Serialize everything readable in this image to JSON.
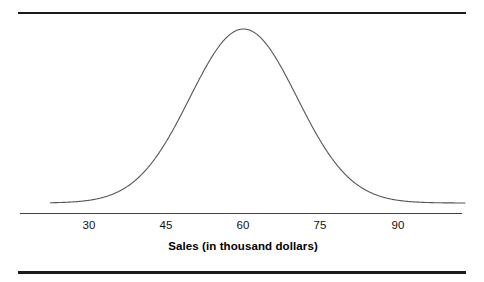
{
  "figure": {
    "background_color": "#ffffff",
    "rule_color": "#1a1a1a",
    "curve_color": "#555555",
    "axis_color": "#444444",
    "top_rule_label": "top-horizontal-rule",
    "bottom_rule_label": "bottom-horizontal-rule"
  },
  "axis": {
    "title": "Sales (in thousand dollars)",
    "tick_labels": [
      "30",
      "45",
      "60",
      "75",
      "90"
    ],
    "tick_values": [
      30,
      45,
      60,
      75,
      90
    ]
  },
  "chart_data": {
    "type": "line",
    "title": "",
    "subtitle": "",
    "xlabel": "Sales (in thousand dollars)",
    "ylabel": "",
    "grid": false,
    "legend": "none",
    "xlim": [
      22.5,
      103.0
    ],
    "ylim": [
      0,
      1.0
    ],
    "xticks": [
      30,
      45,
      60,
      75,
      90
    ],
    "xticklabels": [
      "30",
      "45",
      "60",
      "75",
      "90"
    ],
    "yticks": [],
    "yticklabels": [],
    "distribution": {
      "kind": "normal",
      "mean": 60,
      "sigma": 10.4,
      "peak_x": 60,
      "peak_y": 1.0
    },
    "series": [
      {
        "name": "Normal curve",
        "x": [
          22.5,
          25,
          27.5,
          30,
          32.5,
          35,
          37.5,
          40,
          42.5,
          45,
          47.5,
          50,
          52.5,
          55,
          57.5,
          60,
          62.5,
          65,
          67.5,
          70,
          72.5,
          75,
          77.5,
          80,
          82.5,
          85,
          87.5,
          90,
          92.5,
          95,
          97.5,
          100,
          103
        ],
        "y": [
          0.001,
          0.004,
          0.01,
          0.024,
          0.052,
          0.103,
          0.185,
          0.302,
          0.447,
          0.598,
          0.731,
          0.853,
          0.938,
          0.986,
          1.0,
          1.0,
          1.0,
          0.986,
          0.938,
          0.853,
          0.731,
          0.598,
          0.447,
          0.302,
          0.185,
          0.103,
          0.052,
          0.024,
          0.01,
          0.004,
          0.001,
          0.0,
          0.0
        ]
      }
    ]
  }
}
